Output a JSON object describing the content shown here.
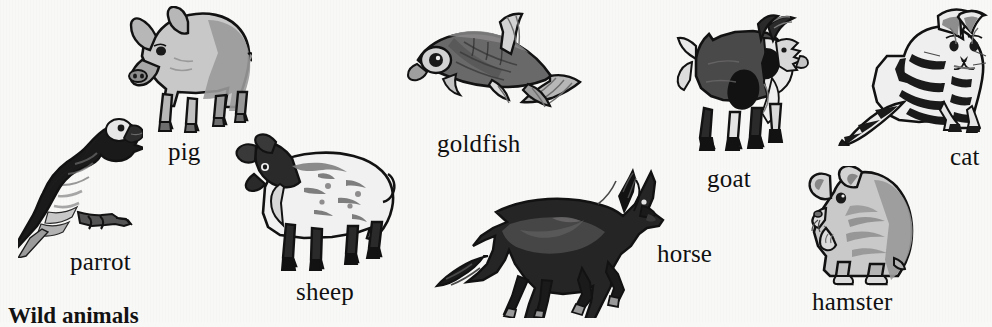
{
  "page": {
    "background_color": "#f8f8f7",
    "ink_color": "#1b1a1a",
    "style": "grayscale scanned illustrations",
    "section_title": "Wild animals"
  },
  "animals": [
    {
      "name": "parrot",
      "label": "parrot",
      "icon": "parrot-illustration",
      "description": "macaw perched on a branch, long tail pointing down-left",
      "tone": "dark gray with light wing bars",
      "label_x": 70,
      "label_y": 248,
      "art_x": 18,
      "art_y": 108,
      "art_w": 125,
      "art_h": 150
    },
    {
      "name": "pig",
      "label": "pig",
      "icon": "pig-illustration",
      "description": "standing pig facing left, snout down",
      "tone": "light gray body with mid-gray shading",
      "label_x": 168,
      "label_y": 138,
      "art_x": 112,
      "art_y": 6,
      "art_w": 140,
      "art_h": 130
    },
    {
      "name": "sheep",
      "label": "sheep",
      "icon": "sheep-illustration",
      "description": "sheep standing, dark head and legs with white woolly fleece",
      "tone": "white fleece, black head and legs",
      "label_x": 296,
      "label_y": 278,
      "art_x": 232,
      "art_y": 130,
      "art_w": 165,
      "art_h": 148
    },
    {
      "name": "goldfish",
      "label": "goldfish",
      "icon": "goldfish-illustration",
      "description": "goldfish facing left with flowing tail and fins",
      "tone": "mid-gray body with pale translucent fins",
      "label_x": 437,
      "label_y": 130,
      "art_x": 404,
      "art_y": 8,
      "art_w": 180,
      "art_h": 122
    },
    {
      "name": "horse",
      "label": "horse",
      "icon": "horse-illustration",
      "description": "dark horse galloping to the right",
      "tone": "near-black with charcoal highlights",
      "label_x": 657,
      "label_y": 240,
      "art_x": 432,
      "art_y": 168,
      "art_w": 235,
      "art_h": 150
    },
    {
      "name": "goat",
      "label": "goat",
      "icon": "goat-illustration",
      "description": "horned goat standing, facing right",
      "tone": "dark gray with black patches and white trim",
      "label_x": 707,
      "label_y": 165,
      "art_x": 672,
      "art_y": 12,
      "art_w": 140,
      "art_h": 152
    },
    {
      "name": "cat",
      "label": "cat",
      "icon": "cat-illustration",
      "description": "striped tabby cat sitting, long banded tail to the left",
      "tone": "black stripes on white",
      "label_x": 950,
      "label_y": 143,
      "art_x": 838,
      "art_y": 6,
      "art_w": 150,
      "art_h": 140
    },
    {
      "name": "hamster",
      "label": "hamster",
      "icon": "hamster-illustration",
      "description": "hamster sitting upright facing left, paws raised",
      "tone": "light gray with mid-gray markings",
      "label_x": 812,
      "label_y": 288,
      "art_x": 800,
      "art_y": 166,
      "art_w": 118,
      "art_h": 124
    }
  ]
}
